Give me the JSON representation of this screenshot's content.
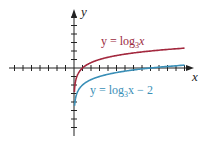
{
  "chart_data": {
    "type": "line",
    "title": "",
    "xlabel": "x",
    "ylabel": "y",
    "xlim": [
      -7.5,
      13.5
    ],
    "ylim": [
      -7.8,
      6.8
    ],
    "grid": false,
    "x_ticks_unit": 1,
    "y_ticks_unit": 1,
    "series": [
      {
        "name": "y = log3 x",
        "label_main": "y = log",
        "label_sub": "3",
        "label_tail": "x",
        "color": "#a3283e",
        "function": "log3(x)",
        "x": [
          0.05,
          0.1,
          0.2,
          0.5,
          1,
          2,
          3,
          5,
          9,
          13
        ],
        "values": [
          -2.73,
          -2.1,
          -1.46,
          -0.63,
          0,
          0.63,
          1,
          1.46,
          2,
          2.33
        ]
      },
      {
        "name": "y = log3 x - 2",
        "label_main": "y = log",
        "label_sub": "3",
        "label_tail": "x − 2",
        "color": "#3a8fb7",
        "function": "log3(x) - 2",
        "x": [
          0.05,
          0.1,
          0.2,
          0.5,
          1,
          2,
          3,
          5,
          9,
          13
        ],
        "values": [
          -4.73,
          -4.1,
          -3.46,
          -2.63,
          -2,
          -1.37,
          -1,
          -0.54,
          0,
          0.33
        ]
      }
    ]
  }
}
